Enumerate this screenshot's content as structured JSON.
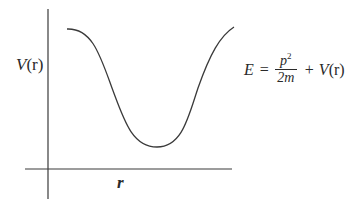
{
  "diagram": {
    "y_axis_label": {
      "symbol": "V",
      "arg": "(r)"
    },
    "x_axis_label": "r",
    "equation": {
      "lhs": "E",
      "equals": "=",
      "frac_num_base": "p",
      "frac_num_exp": "2",
      "frac_den": "2m",
      "plus": "+",
      "potential_symbol": "V",
      "potential_arg": "(r)"
    },
    "curve": {
      "description": "Potential well: starts high at left, dips to a minimum, rises high at right",
      "start_point": [
        67,
        29
      ],
      "minimum_point": [
        157,
        147
      ],
      "end_point": [
        234,
        27
      ]
    },
    "colors": {
      "line": "#3a3a3a",
      "text": "#2a2a2a",
      "background": "#ffffff"
    }
  }
}
